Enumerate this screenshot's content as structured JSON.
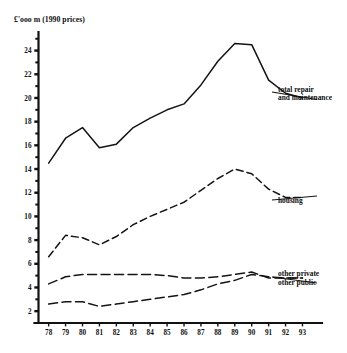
{
  "chart_data": {
    "type": "line",
    "title": "£'ooo m  (1990 prices)",
    "xlabel": "",
    "ylabel": "£'ooo m (1990 prices)",
    "grid": false,
    "legend_position": "right-inline-annotations",
    "categories": [
      "78",
      "79",
      "80",
      "81",
      "82",
      "83",
      "84",
      "85",
      "86",
      "87",
      "88",
      "89",
      "90",
      "91",
      "92",
      "93"
    ],
    "x": [
      78,
      79,
      80,
      81,
      82,
      83,
      84,
      85,
      86,
      87,
      88,
      89,
      90,
      91,
      92,
      93
    ],
    "ylim": [
      1,
      25.4
    ],
    "xlim": [
      77.4,
      93.8
    ],
    "ytick_major": [
      2,
      4,
      6,
      8,
      10,
      12,
      14,
      16,
      18,
      20,
      22,
      24
    ],
    "ytick_minor": [
      3,
      5,
      7,
      9,
      11,
      13,
      15,
      17,
      19,
      21,
      23,
      25
    ],
    "series": [
      {
        "name": "total repair and maintenance",
        "label_lines": [
          "total repair",
          "and maintenance"
        ],
        "style": "solid",
        "values": [
          14.5,
          16.6,
          17.5,
          15.8,
          16.1,
          17.5,
          18.3,
          19.0,
          19.5,
          21.1,
          23.1,
          24.6,
          24.5,
          21.5,
          20.4,
          20.0
        ]
      },
      {
        "name": "housing",
        "label_lines": [
          "housing"
        ],
        "style": "dashed-medium",
        "values": [
          6.6,
          8.4,
          8.2,
          7.6,
          8.3,
          9.3,
          10.0,
          10.6,
          11.2,
          12.2,
          13.2,
          14.0,
          13.6,
          12.3,
          11.6,
          11.6
        ]
      },
      {
        "name": "other private",
        "label_lines": [
          "other private"
        ],
        "style": "dashed-long",
        "values": [
          4.3,
          4.9,
          5.1,
          5.1,
          5.1,
          5.1,
          5.1,
          5.0,
          4.8,
          4.8,
          4.9,
          5.1,
          5.3,
          4.8,
          4.8,
          4.8
        ]
      },
      {
        "name": "other public",
        "label_lines": [
          "other public"
        ],
        "style": "dashed-long",
        "values": [
          2.6,
          2.8,
          2.8,
          2.4,
          2.6,
          2.8,
          3.0,
          3.2,
          3.4,
          3.8,
          4.3,
          4.6,
          5.1,
          4.9,
          4.8,
          4.8
        ]
      }
    ],
    "annotations": [
      {
        "text": "total repair and maintenance",
        "anchor_year": 93,
        "anchor_value": 20.0
      },
      {
        "text": "housing",
        "anchor_year": 93,
        "anchor_value": 11.6
      },
      {
        "text": "other private",
        "anchor_year": 93,
        "anchor_value": 4.8
      },
      {
        "text": "other public",
        "anchor_year": 93,
        "anchor_value": 4.8
      }
    ],
    "colors": {
      "ink": "#141414",
      "background": "#ffffff"
    }
  }
}
